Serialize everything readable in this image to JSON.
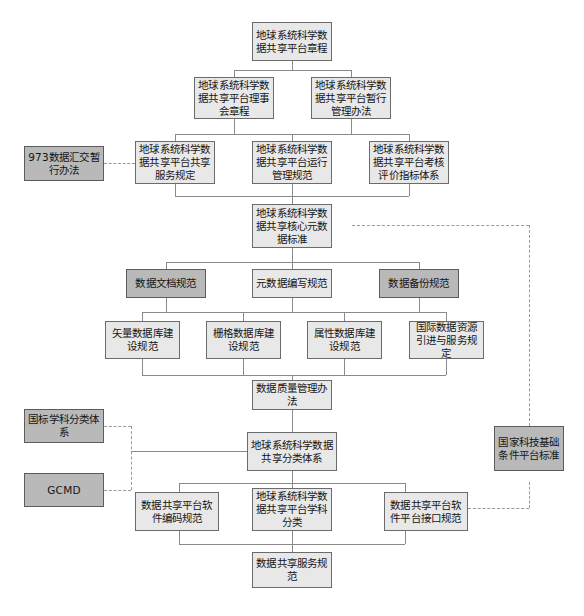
{
  "diagram": {
    "type": "flowchart",
    "colors": {
      "node_fill": "#e8e8e8",
      "node_fill_shaded": "#b9b9b9",
      "node_border": "#6b6b6b",
      "connector": "#8a8a8a",
      "connector_dashed": "#9a9a9a"
    },
    "nodes": [
      {
        "id": "n1",
        "label": "地球系统科学数据共享平台章程",
        "shaded": false
      },
      {
        "id": "n2",
        "label": "地球系统科学数据共享平台理事会章程",
        "shaded": false
      },
      {
        "id": "n3",
        "label": "地球系统科学数据共享平台暂行管理办法",
        "shaded": false
      },
      {
        "id": "n4",
        "label": "973数据汇交暂行办法",
        "shaded": true
      },
      {
        "id": "n5",
        "label": "地球系统科学数据共享平台共享服务规定",
        "shaded": false
      },
      {
        "id": "n6",
        "label": "地球系统科学数据共享平台运行管理规范",
        "shaded": false
      },
      {
        "id": "n7",
        "label": "地球系统科学数据共享平台考核评价指标体系",
        "shaded": false
      },
      {
        "id": "n8",
        "label": "地球系统科学数据共享核心元数据标准",
        "shaded": false
      },
      {
        "id": "n9",
        "label": "数据文档规范",
        "shaded": true
      },
      {
        "id": "n10",
        "label": "元数据编写规范",
        "shaded": false
      },
      {
        "id": "n11",
        "label": "数据备份规范",
        "shaded": true
      },
      {
        "id": "n12",
        "label": "矢量数据库建设规范",
        "shaded": false
      },
      {
        "id": "n13",
        "label": "栅格数据库建设规范",
        "shaded": false
      },
      {
        "id": "n14",
        "label": "属性数据库建设规范",
        "shaded": false
      },
      {
        "id": "n15",
        "label": "国际数据资源引进与服务规定",
        "shaded": false
      },
      {
        "id": "n16",
        "label": "数据质量管理办法",
        "shaded": false
      },
      {
        "id": "n17",
        "label": "国标学科分类体系",
        "shaded": true
      },
      {
        "id": "n18",
        "label": "GCMD",
        "shaded": true
      },
      {
        "id": "n19",
        "label": "地球系统科学数据共享分类体系",
        "shaded": false
      },
      {
        "id": "n20",
        "label": "国家科技基础条件平台标准",
        "shaded": true
      },
      {
        "id": "n21",
        "label": "数据共享平台软件编码规范",
        "shaded": false
      },
      {
        "id": "n22",
        "label": "地球系统科学数据共享平台学科分类",
        "shaded": false
      },
      {
        "id": "n23",
        "label": "数据共享平台软件平台接口规范",
        "shaded": false
      },
      {
        "id": "n24",
        "label": "数据共享服务规范",
        "shaded": false
      }
    ]
  }
}
